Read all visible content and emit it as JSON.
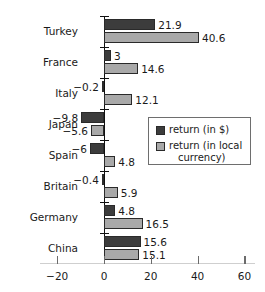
{
  "chart_data": {
    "type": "bar",
    "orientation": "horizontal",
    "title": "",
    "subtitle": "",
    "xlabel": "",
    "ylabel": "",
    "categories": [
      "Turkey",
      "France",
      "Italy",
      "Japan",
      "Spain",
      "Britain",
      "Germany",
      "China"
    ],
    "series": [
      {
        "name": "return (in $)",
        "color": "#3c3c3c",
        "values": [
          21.9,
          3,
          -0.2,
          -9.8,
          -6,
          -0.4,
          4.8,
          15.6
        ],
        "labels": [
          "21.9",
          "3",
          "−0.2",
          "−9.8",
          "−6",
          "−0.4",
          "4.8",
          "15.6"
        ]
      },
      {
        "name": "return (in local currency)",
        "color": "#a9a9a9",
        "values": [
          40.6,
          14.6,
          12.1,
          -5.6,
          4.8,
          5.9,
          16.5,
          15.1
        ],
        "labels": [
          "40.6",
          "14.6",
          "12.1",
          "−5.6",
          "4.8",
          "5.9",
          "16.5",
          "15.1"
        ]
      }
    ],
    "xlim": [
      -20,
      60
    ],
    "xticks": [
      -20,
      0,
      20,
      40,
      60
    ],
    "xtick_labels": [
      "−20",
      "0",
      "20",
      "40",
      "60"
    ],
    "grid": false,
    "legend": {
      "position": "middle-right",
      "entries": [
        {
          "label": "return (in $)",
          "label_line2": "",
          "swatch": "dollar"
        },
        {
          "label": "return (in local",
          "label_line2": "currency)",
          "swatch": "local"
        }
      ]
    }
  },
  "axis": {
    "zero_line_color": "#101010",
    "tick_color": "#6b6b6b"
  }
}
